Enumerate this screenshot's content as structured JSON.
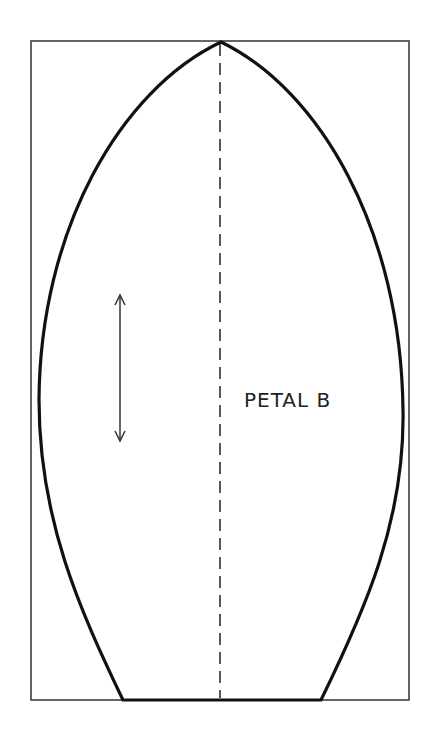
{
  "diagram": {
    "piece_label": "PETAL B",
    "elements": {
      "border": "rectangle frame",
      "outline": "pointed petal shape with flat base",
      "center_line": "dashed fold/center line",
      "grainline": "double-headed vertical arrow"
    },
    "colors": {
      "line": "#111111",
      "frame": "#333333",
      "background": "#ffffff"
    }
  }
}
